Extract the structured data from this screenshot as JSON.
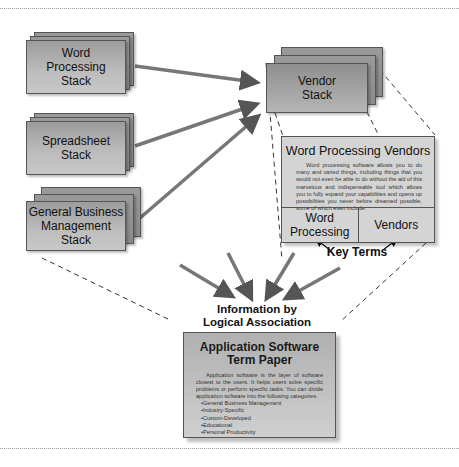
{
  "diagram": {
    "stacks": [
      {
        "id": "word-processing",
        "label": "Word Processing Stack",
        "lines": [
          "Word",
          "Processing",
          "Stack"
        ]
      },
      {
        "id": "spreadsheet",
        "label": "Spreadsheet Stack",
        "lines": [
          "Spreadsheet",
          "Stack"
        ]
      },
      {
        "id": "general-business",
        "label": "General Business Management Stack",
        "lines": [
          "General Business",
          "Management",
          "Stack"
        ]
      },
      {
        "id": "vendor",
        "label": "Vendor Stack",
        "lines": [
          "Vendor",
          "Stack"
        ]
      }
    ],
    "vendor_panel": {
      "title": "Word Processing Vendors",
      "body": "Word processing software allows you to do many and varied things, including things that you would not even be able to do without the aid of this marvelous and indispensable tool which allows you to fully expand your capabilities and opens up possibilities you never before dreamed possible, some of which even include:",
      "terms": [
        {
          "lines": [
            "Word",
            "Processing"
          ]
        },
        {
          "lines": [
            "Vendors"
          ]
        }
      ]
    },
    "key_terms_label": "Key Terms",
    "association_label": [
      "Information by",
      "Logical Association"
    ],
    "term_paper": {
      "title": [
        "Application Software",
        "Term Paper"
      ],
      "body": "Application software is the layer of software closest to the users. It helps users solve specific problems or perform specific tasks. You can divide application software into the following categories:",
      "bullets": [
        "•General Business Management",
        "•Industry-Specific",
        "•Custom-Developed",
        "•Educational",
        "•Personal Productivity"
      ]
    },
    "colors": {
      "box_fill": "#bdbdbd",
      "box_border": "#555555",
      "arrow": "#6a6a6a",
      "panel_fill": "#d4d4d4"
    }
  }
}
